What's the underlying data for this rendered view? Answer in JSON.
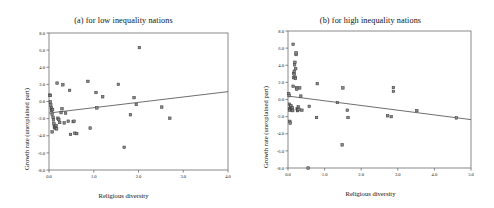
{
  "figure": {
    "background": "#ffffff",
    "point_fill": "#8b8b8b",
    "point_stroke": "#3d3d3d",
    "line_color": "#4a4a4a",
    "axis_color": "#6d6d6d"
  },
  "chart_data": [
    {
      "type": "scatter",
      "panel": "a",
      "title": "(a) for low inequality nations",
      "xlabel": "Religious diversity",
      "ylabel": "Growth rate (unexplained part)",
      "xlim": [
        0.0,
        4.0
      ],
      "ylim": [
        -8.0,
        8.0
      ],
      "xticks": [
        0.0,
        1.0,
        2.0,
        3.0,
        4.0
      ],
      "xtick_labels": [
        "0.0",
        "1.0",
        "2.0",
        "3.0",
        "4.0"
      ],
      "yticks": [
        8.0,
        6.0,
        4.0,
        2.0,
        0.0,
        -2.0,
        -4.0,
        -6.0,
        -8.0
      ],
      "ytick_labels": [
        "8.0",
        "6.0",
        "4.0",
        "2.0",
        "0.0",
        "-2.0",
        "-4.0",
        "-6.0",
        "-8.0"
      ],
      "grid": false,
      "legend": "none",
      "marker": "square",
      "trendline": {
        "x0": 0.0,
        "y0": -1.35,
        "x1": 4.0,
        "y1": 1.15
      },
      "points": [
        {
          "x": 0.02,
          "y": 0.75
        },
        {
          "x": 0.03,
          "y": 0.7
        },
        {
          "x": 0.03,
          "y": -0.05
        },
        {
          "x": 0.04,
          "y": -0.4
        },
        {
          "x": 0.05,
          "y": -0.75
        },
        {
          "x": 0.06,
          "y": -0.9
        },
        {
          "x": 0.06,
          "y": -1.05
        },
        {
          "x": 0.07,
          "y": -1.5
        },
        {
          "x": 0.07,
          "y": -3.55
        },
        {
          "x": 0.08,
          "y": -0.95
        },
        {
          "x": 0.09,
          "y": -1.85
        },
        {
          "x": 0.1,
          "y": -2.15
        },
        {
          "x": 0.11,
          "y": -2.6
        },
        {
          "x": 0.12,
          "y": -2.95
        },
        {
          "x": 0.13,
          "y": -3.05
        },
        {
          "x": 0.14,
          "y": -3.1
        },
        {
          "x": 0.15,
          "y": -3.0
        },
        {
          "x": 0.16,
          "y": -2.8
        },
        {
          "x": 0.17,
          "y": -3.2
        },
        {
          "x": 0.18,
          "y": 2.15
        },
        {
          "x": 0.2,
          "y": -1.95
        },
        {
          "x": 0.22,
          "y": -2.1
        },
        {
          "x": 0.24,
          "y": -2.45
        },
        {
          "x": 0.27,
          "y": -1.3
        },
        {
          "x": 0.29,
          "y": -0.85
        },
        {
          "x": 0.31,
          "y": 1.95
        },
        {
          "x": 0.34,
          "y": -2.5
        },
        {
          "x": 0.37,
          "y": -1.35
        },
        {
          "x": 0.43,
          "y": -2.3
        },
        {
          "x": 0.46,
          "y": 1.3
        },
        {
          "x": 0.48,
          "y": -3.85
        },
        {
          "x": 0.54,
          "y": -2.35
        },
        {
          "x": 0.56,
          "y": -2.3
        },
        {
          "x": 0.58,
          "y": -3.7
        },
        {
          "x": 0.62,
          "y": -3.75
        },
        {
          "x": 0.87,
          "y": 2.35
        },
        {
          "x": 0.92,
          "y": -3.1
        },
        {
          "x": 1.05,
          "y": 1.05
        },
        {
          "x": 1.07,
          "y": -0.75
        },
        {
          "x": 1.2,
          "y": 0.55
        },
        {
          "x": 1.55,
          "y": 2.0
        },
        {
          "x": 1.68,
          "y": -5.35
        },
        {
          "x": 1.82,
          "y": -1.55
        },
        {
          "x": 1.9,
          "y": 0.45
        },
        {
          "x": 1.95,
          "y": -0.35
        },
        {
          "x": 2.02,
          "y": 6.3
        },
        {
          "x": 2.52,
          "y": -0.65
        },
        {
          "x": 2.7,
          "y": -1.95
        }
      ]
    },
    {
      "type": "scatter",
      "panel": "b",
      "title": "(b) for high inequality nations",
      "xlabel": "Religious diversity",
      "ylabel": "Growth rate (unexplained part)",
      "xlim": [
        0.0,
        5.0
      ],
      "ylim": [
        -8.0,
        8.0
      ],
      "xticks": [
        0.0,
        1.0,
        2.0,
        3.0,
        4.0,
        5.0
      ],
      "xtick_labels": [
        "0.0",
        "1.0",
        "2.0",
        "3.0",
        "4.0",
        "5.0"
      ],
      "yticks": [
        8.0,
        6.0,
        4.0,
        2.0,
        0.0,
        -2.0,
        -4.0,
        -6.0,
        -8.0
      ],
      "ytick_labels": [
        "8.0",
        "6.0",
        "4.0",
        "2.0",
        "0.0",
        "-2.0",
        "-4.0",
        "-6.0",
        "-8.0"
      ],
      "grid": false,
      "legend": "none",
      "marker": "square",
      "trendline": {
        "x0": 0.0,
        "y0": 0.4,
        "x1": 5.0,
        "y1": -2.35
      },
      "points": [
        {
          "x": 0.02,
          "y": 0.7
        },
        {
          "x": 0.03,
          "y": 0.45
        },
        {
          "x": 0.04,
          "y": -0.55
        },
        {
          "x": 0.04,
          "y": -1.05
        },
        {
          "x": 0.05,
          "y": -1.25
        },
        {
          "x": 0.05,
          "y": -2.55
        },
        {
          "x": 0.06,
          "y": -2.75
        },
        {
          "x": 0.07,
          "y": -0.9
        },
        {
          "x": 0.08,
          "y": -0.7
        },
        {
          "x": 0.09,
          "y": -1.15
        },
        {
          "x": 0.1,
          "y": -1.05
        },
        {
          "x": 0.11,
          "y": -1.2
        },
        {
          "x": 0.12,
          "y": -0.95
        },
        {
          "x": 0.13,
          "y": -1.3
        },
        {
          "x": 0.14,
          "y": 1.55
        },
        {
          "x": 0.14,
          "y": 6.45
        },
        {
          "x": 0.15,
          "y": 2.55
        },
        {
          "x": 0.16,
          "y": 3.05
        },
        {
          "x": 0.17,
          "y": 3.3
        },
        {
          "x": 0.17,
          "y": 2.95
        },
        {
          "x": 0.18,
          "y": 4.05
        },
        {
          "x": 0.19,
          "y": 4.35
        },
        {
          "x": 0.2,
          "y": 2.6
        },
        {
          "x": 0.2,
          "y": 2.45
        },
        {
          "x": 0.21,
          "y": 3.6
        },
        {
          "x": 0.22,
          "y": 5.25
        },
        {
          "x": 0.22,
          "y": 5.45
        },
        {
          "x": 0.23,
          "y": 1.4
        },
        {
          "x": 0.24,
          "y": 1.2
        },
        {
          "x": 0.25,
          "y": -1.1
        },
        {
          "x": 0.26,
          "y": -1.3
        },
        {
          "x": 0.27,
          "y": -1.2
        },
        {
          "x": 0.28,
          "y": -0.85
        },
        {
          "x": 0.3,
          "y": -1.15
        },
        {
          "x": 0.32,
          "y": 1.35
        },
        {
          "x": 0.35,
          "y": 0.4
        },
        {
          "x": 0.38,
          "y": -1.25
        },
        {
          "x": 0.55,
          "y": -8.0
        },
        {
          "x": 0.58,
          "y": -0.8
        },
        {
          "x": 0.78,
          "y": -2.1
        },
        {
          "x": 0.8,
          "y": 1.85
        },
        {
          "x": 1.35,
          "y": -0.35
        },
        {
          "x": 1.48,
          "y": -5.3
        },
        {
          "x": 1.5,
          "y": 1.35
        },
        {
          "x": 1.62,
          "y": -1.25
        },
        {
          "x": 1.64,
          "y": -2.1
        },
        {
          "x": 2.72,
          "y": -1.9
        },
        {
          "x": 2.82,
          "y": -2.0
        },
        {
          "x": 2.88,
          "y": 1.4
        },
        {
          "x": 2.88,
          "y": 0.95
        },
        {
          "x": 3.52,
          "y": -1.3
        },
        {
          "x": 4.6,
          "y": -2.15
        }
      ]
    }
  ]
}
